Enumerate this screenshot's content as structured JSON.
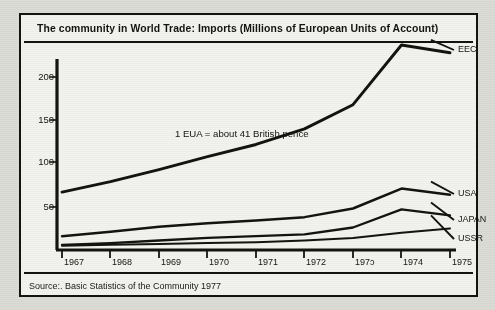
{
  "title": "The community in World Trade:  Imports (Millions of European Units of Account)",
  "source": "Source:. Basic Statistics of the Community 1977",
  "annotation": "1 EUA = about 41 British pence",
  "colors": {
    "ink": "#14140f",
    "paper": "#f2f2ee",
    "page": "#dcdcd7"
  },
  "chart_data": {
    "type": "line",
    "title": "The community in World Trade:  Imports (Millions of European Units of Account)",
    "xlabel": "",
    "ylabel": "",
    "x": [
      1967,
      1968,
      1969,
      1970,
      1971,
      1972,
      1973,
      1974,
      1975
    ],
    "xtick_labels": [
      "1967",
      "1968",
      "1969",
      "1970",
      "1971",
      "1972",
      "197ɔ",
      "1974",
      "1975"
    ],
    "ytick_labels": [
      "50",
      "100",
      "150",
      "200"
    ],
    "yticks": [
      50,
      100,
      150,
      200
    ],
    "ylim": [
      0,
      240
    ],
    "xlim": [
      1967,
      1975
    ],
    "grid": false,
    "legend": "right-inline-labels",
    "annotations": [
      {
        "text": "1 EUA = about 41 British pence",
        "x": 1969.7,
        "y": 133
      }
    ],
    "series": [
      {
        "name": "EEC",
        "values": [
          67,
          79,
          93,
          108,
          122,
          140,
          168,
          237,
          228
        ]
      },
      {
        "name": "USA",
        "values": [
          16,
          21,
          27,
          31,
          34,
          38,
          48,
          71,
          64
        ]
      },
      {
        "name": "JAPAN",
        "values": [
          6,
          8,
          11,
          14,
          16,
          18,
          26,
          47,
          40
        ]
      },
      {
        "name": "USSR",
        "values": [
          5,
          6,
          7,
          8,
          9,
          11,
          14,
          20,
          25
        ]
      }
    ]
  },
  "axis": {
    "y_ticks": [
      {
        "label": "200",
        "y": 75
      },
      {
        "label": "150",
        "y": 118
      },
      {
        "label": "100",
        "y": 160
      },
      {
        "label": "50",
        "y": 205
      }
    ],
    "x_ticks": [
      {
        "label": "1967",
        "x": 60
      },
      {
        "label": "1968",
        "x": 108
      },
      {
        "label": "1969",
        "x": 157
      },
      {
        "label": "1970",
        "x": 205
      },
      {
        "label": "1971",
        "x": 254
      },
      {
        "label": "1972",
        "x": 302
      },
      {
        "label": "197ɔ",
        "x": 351
      },
      {
        "label": "1974",
        "x": 399
      },
      {
        "label": "1975",
        "x": 448
      }
    ]
  },
  "series_labels": [
    {
      "name": "EEC",
      "x": 456,
      "y": 48
    },
    {
      "name": "USA",
      "x": 456,
      "y": 192
    },
    {
      "name": "JAPAN",
      "x": 456,
      "y": 218
    },
    {
      "name": "USSR",
      "x": 456,
      "y": 237
    }
  ]
}
